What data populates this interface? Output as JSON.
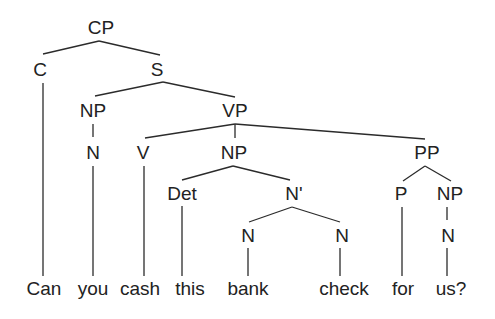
{
  "diagram": {
    "type": "syntax-tree",
    "sentence": [
      "Can",
      "you",
      "cash",
      "this",
      "bank",
      "check",
      "for",
      "us?"
    ],
    "nodes": [
      {
        "id": "cp",
        "label": "CP",
        "x": 101,
        "y": 27
      },
      {
        "id": "c",
        "label": "C",
        "x": 40,
        "y": 69
      },
      {
        "id": "s",
        "label": "S",
        "x": 157,
        "y": 69
      },
      {
        "id": "np1",
        "label": "NP",
        "x": 93,
        "y": 110
      },
      {
        "id": "vp",
        "label": "VP",
        "x": 235,
        "y": 110
      },
      {
        "id": "n1",
        "label": "N",
        "x": 93,
        "y": 152
      },
      {
        "id": "v",
        "label": "V",
        "x": 143,
        "y": 152
      },
      {
        "id": "np2",
        "label": "NP",
        "x": 234,
        "y": 152
      },
      {
        "id": "pp",
        "label": "PP",
        "x": 427,
        "y": 152
      },
      {
        "id": "det",
        "label": "Det",
        "x": 182,
        "y": 193
      },
      {
        "id": "nbar",
        "label": "N'",
        "x": 294,
        "y": 193
      },
      {
        "id": "p",
        "label": "P",
        "x": 401,
        "y": 193
      },
      {
        "id": "np3",
        "label": "NP",
        "x": 450,
        "y": 193
      },
      {
        "id": "n2",
        "label": "N",
        "x": 248,
        "y": 235
      },
      {
        "id": "n3",
        "label": "N",
        "x": 342,
        "y": 235
      },
      {
        "id": "n4",
        "label": "N",
        "x": 448,
        "y": 235
      }
    ],
    "words": [
      {
        "id": "w-can",
        "label": "Can",
        "x": 44,
        "y": 288
      },
      {
        "id": "w-you",
        "label": "you",
        "x": 93,
        "y": 288
      },
      {
        "id": "w-cash",
        "label": "cash",
        "x": 140,
        "y": 288
      },
      {
        "id": "w-this",
        "label": "this",
        "x": 190,
        "y": 288
      },
      {
        "id": "w-bank",
        "label": "bank",
        "x": 248,
        "y": 288
      },
      {
        "id": "w-check",
        "label": "check",
        "x": 344,
        "y": 288
      },
      {
        "id": "w-for",
        "label": "for",
        "x": 403,
        "y": 288
      },
      {
        "id": "w-us",
        "label": "us?",
        "x": 451,
        "y": 288
      }
    ],
    "edges": [
      {
        "x1": 99,
        "y1": 41,
        "x2": 43,
        "y2": 54
      },
      {
        "x1": 99,
        "y1": 41,
        "x2": 160,
        "y2": 55
      },
      {
        "x1": 163,
        "y1": 82,
        "x2": 95,
        "y2": 96
      },
      {
        "x1": 163,
        "y1": 82,
        "x2": 235,
        "y2": 97
      },
      {
        "x1": 93,
        "y1": 124,
        "x2": 93,
        "y2": 137
      },
      {
        "x1": 235,
        "y1": 124,
        "x2": 145,
        "y2": 138
      },
      {
        "x1": 235,
        "y1": 124,
        "x2": 235,
        "y2": 138
      },
      {
        "x1": 235,
        "y1": 124,
        "x2": 425,
        "y2": 139
      },
      {
        "x1": 233,
        "y1": 166,
        "x2": 182,
        "y2": 180
      },
      {
        "x1": 233,
        "y1": 166,
        "x2": 290,
        "y2": 180
      },
      {
        "x1": 425,
        "y1": 166,
        "x2": 403,
        "y2": 181
      },
      {
        "x1": 425,
        "y1": 166,
        "x2": 451,
        "y2": 181
      },
      {
        "x1": 292,
        "y1": 207,
        "x2": 249,
        "y2": 222
      },
      {
        "x1": 292,
        "y1": 207,
        "x2": 340,
        "y2": 222
      },
      {
        "x1": 43,
        "y1": 83,
        "x2": 43,
        "y2": 276
      },
      {
        "x1": 93,
        "y1": 166,
        "x2": 93,
        "y2": 276
      },
      {
        "x1": 144,
        "y1": 166,
        "x2": 144,
        "y2": 276
      },
      {
        "x1": 182,
        "y1": 206,
        "x2": 182,
        "y2": 276
      },
      {
        "x1": 248,
        "y1": 248,
        "x2": 248,
        "y2": 276
      },
      {
        "x1": 340,
        "y1": 248,
        "x2": 340,
        "y2": 276
      },
      {
        "x1": 402,
        "y1": 207,
        "x2": 402,
        "y2": 276
      },
      {
        "x1": 447,
        "y1": 207,
        "x2": 447,
        "y2": 220
      },
      {
        "x1": 447,
        "y1": 248,
        "x2": 447,
        "y2": 276
      }
    ],
    "colors": {
      "line": "#2b2b2b",
      "text": "#222222",
      "background": "#ffffff"
    }
  }
}
